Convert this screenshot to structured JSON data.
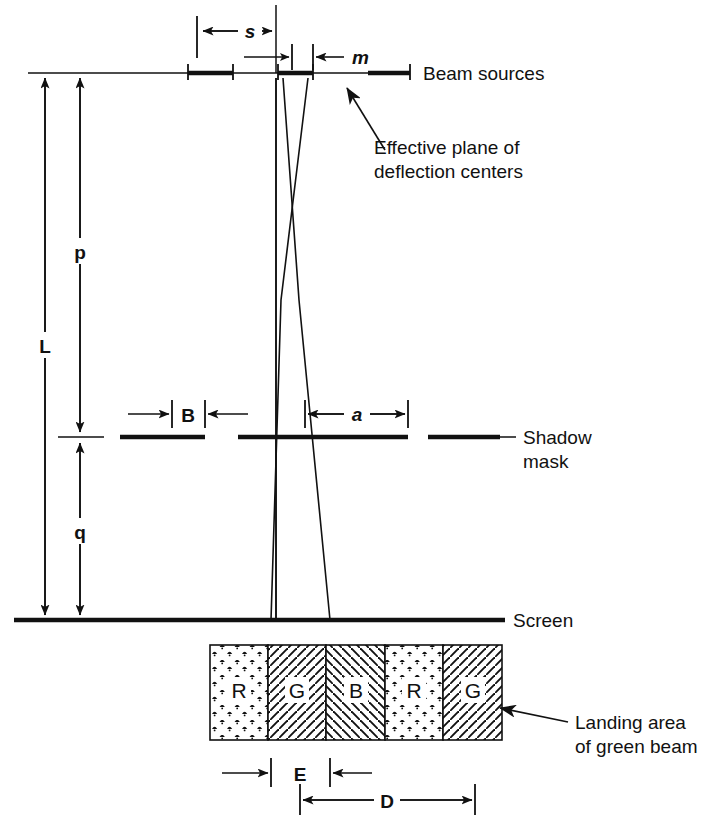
{
  "figure": {
    "background_color": "#ffffff",
    "ink_color": "#111111"
  },
  "labels": {
    "beam_sources": "Beam sources",
    "effective_plane_line1": "Effective plane of",
    "effective_plane_line2": "deflection centers",
    "shadow_mask_line1": "Shadow",
    "shadow_mask_line2": "mask",
    "screen": "Screen",
    "landing_area_line1": "Landing area",
    "landing_area_line2": "of green beam"
  },
  "dimensions": {
    "s": "s",
    "m": "m",
    "L": "L",
    "p": "p",
    "q": "q",
    "B": "B",
    "a": "a",
    "E": "E",
    "D": "D"
  },
  "phosphor_stripes": [
    {
      "letter": "R",
      "pattern": "stipple"
    },
    {
      "letter": "G",
      "pattern": "hatch-forward"
    },
    {
      "letter": "B",
      "pattern": "hatch-back"
    },
    {
      "letter": "R",
      "pattern": "stipple"
    },
    {
      "letter": "G",
      "pattern": "hatch-forward"
    }
  ]
}
